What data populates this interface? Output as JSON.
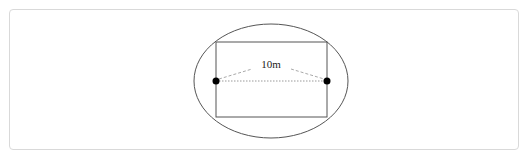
{
  "diagram": {
    "label": "10m",
    "shapes": {
      "ellipse": {
        "cx": 271,
        "cy": 81,
        "rx": 77,
        "ry": 57
      },
      "rectangle": {
        "x": 216,
        "y": 42,
        "width": 111,
        "height": 75
      },
      "points": [
        {
          "x": 216,
          "y": 81
        },
        {
          "x": 327,
          "y": 81
        }
      ]
    },
    "colors": {
      "stroke": "#555555",
      "dot": "#000000",
      "frame": "#d9d9d9"
    }
  }
}
